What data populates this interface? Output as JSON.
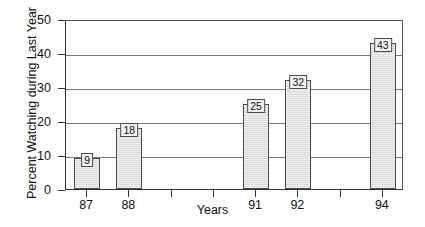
{
  "chart_data": {
    "type": "bar",
    "title": "",
    "xlabel": "Years",
    "ylabel": "Percent Watching during Last Year",
    "categories": [
      "87",
      "88",
      "89",
      "90",
      "91",
      "92",
      "93",
      "94"
    ],
    "tick_labels": [
      "87",
      "88",
      "",
      "",
      "91",
      "92",
      "",
      "94"
    ],
    "values": [
      9,
      18,
      null,
      null,
      25,
      32,
      null,
      43
    ],
    "bars": [
      {
        "category": "87",
        "value": 9,
        "label": "9"
      },
      {
        "category": "88",
        "value": 18,
        "label": "18"
      },
      {
        "category": "91",
        "value": 25,
        "label": "25"
      },
      {
        "category": "92",
        "value": 32,
        "label": "32"
      },
      {
        "category": "94",
        "value": 43,
        "label": "43"
      }
    ],
    "ylim": [
      0,
      50
    ],
    "yticks": [
      0,
      10,
      20,
      30,
      40,
      50
    ],
    "ytick_labels": [
      "0",
      "10",
      "20",
      "30",
      "40",
      "50"
    ],
    "grid": true,
    "grid_axis": "y",
    "legend": null,
    "colors": {
      "bar_fill": "#dcdcdc",
      "bar_edge": "#4a4a4a",
      "gridline": "#777777",
      "axis": "#333333",
      "text": "#111111",
      "background": "#ffffff",
      "label_box_fill": "#f2f2f2"
    }
  }
}
